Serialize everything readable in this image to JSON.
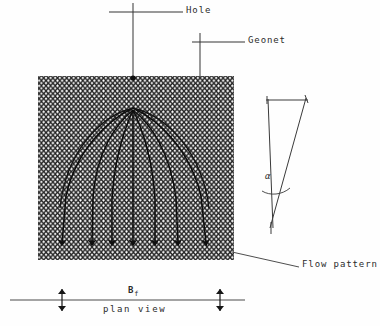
{
  "figure": {
    "caption": "plan view",
    "labels": {
      "hole": "Hole",
      "geonet": "Geonet",
      "flow_pattern": "Flow pattern",
      "plan_view": "plan view",
      "width_symbol": "B",
      "width_subscript": "f",
      "angle_symbol": "α"
    },
    "colors": {
      "ink": "#1a1a1a",
      "line": "#3a3a3a",
      "mesh": "#222222",
      "background": "#fefefe"
    },
    "geometry": {
      "geonet_rect": {
        "x": 38,
        "y": 76,
        "width": 196,
        "height": 184
      },
      "hole_point": {
        "x": 133,
        "y": 78
      },
      "flow_origin": {
        "x": 133,
        "y": 108
      },
      "flow_arrow_tips_y": 249,
      "flow_arrow_tips_x": [
        62,
        92,
        112,
        133,
        155,
        178,
        206
      ],
      "scale_line_y": 300,
      "scale_line_x1": 10,
      "scale_line_x2": 245,
      "scale_ticks_x": [
        62,
        220
      ],
      "angle_apex": {
        "x": 271,
        "y": 222
      },
      "angle_top_bar": {
        "x1": 267,
        "x2": 307,
        "y": 100
      }
    }
  }
}
